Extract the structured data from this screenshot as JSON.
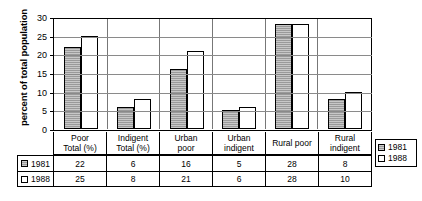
{
  "chart_data": {
    "type": "bar",
    "title": "",
    "xlabel": "",
    "ylabel": "percent of total population",
    "ylim": [
      0,
      30
    ],
    "yticks": [
      0,
      5,
      10,
      15,
      20,
      25,
      30
    ],
    "grid": true,
    "legend_position": "right",
    "categories": [
      "Poor\nTotal (%)",
      "Indigent\nTotal (%)",
      "Urban\npoor",
      "Urban\nindigent",
      "Rural poor",
      "Rural\nindigent"
    ],
    "category_lines": [
      [
        "Poor",
        "Total (%)"
      ],
      [
        "Indigent",
        "Total (%)"
      ],
      [
        "Urban",
        "poor"
      ],
      [
        "Urban",
        "indigent"
      ],
      [
        "Rural poor",
        ""
      ],
      [
        "Rural",
        "indigent"
      ]
    ],
    "series": [
      {
        "name": "1981",
        "values": [
          22,
          6,
          16,
          5,
          28,
          8
        ],
        "color": "#9a9a9a"
      },
      {
        "name": "1988",
        "values": [
          25,
          8,
          21,
          6,
          28,
          10
        ],
        "color": "#ffffff"
      }
    ]
  },
  "legend": {
    "items": [
      {
        "label": "1981"
      },
      {
        "label": "1988"
      }
    ]
  },
  "table": {
    "rows": [
      {
        "label": "1981",
        "values": [
          "22",
          "6",
          "16",
          "5",
          "28",
          "8"
        ]
      },
      {
        "label": "1988",
        "values": [
          "25",
          "8",
          "21",
          "6",
          "28",
          "10"
        ]
      }
    ]
  }
}
